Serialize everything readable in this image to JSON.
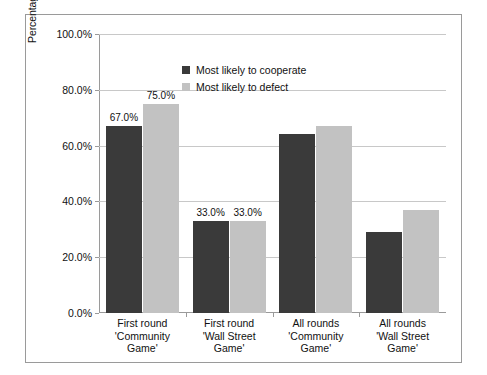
{
  "chart_data": {
    "type": "bar",
    "title": "",
    "xlabel": "",
    "ylabel": "Percentage of participants cooperating",
    "ylim": [
      0,
      100
    ],
    "ytick_labels": [
      "0.0%",
      "20.0%",
      "40.0%",
      "60.0%",
      "80.0%",
      "100.0%"
    ],
    "ytick_values": [
      0,
      20,
      40,
      60,
      80,
      100
    ],
    "grid": true,
    "legend_position": "top-left inside plot",
    "categories": [
      "First round 'Community Game'",
      "First round 'Wall Street Game'",
      "All rounds 'Community Game'",
      "All rounds 'Wall Street Game'"
    ],
    "category_lines": [
      [
        "First round",
        "'Community",
        "Game'"
      ],
      [
        "First round",
        "'Wall Street",
        "Game'"
      ],
      [
        "All rounds",
        "'Community",
        "Game'"
      ],
      [
        "All rounds",
        "'Wall Street",
        "Game'"
      ]
    ],
    "series": [
      {
        "name": "Most likely to cooperate",
        "color": "#3a3a3a",
        "values": [
          67.0,
          33.0,
          64.0,
          29.0
        ],
        "labels": [
          "67.0%",
          "33.0%",
          "",
          ""
        ]
      },
      {
        "name": "Most likely to defect",
        "color": "#c2c2c2",
        "values": [
          75.0,
          33.0,
          67.0,
          37.0
        ],
        "labels": [
          "75.0%",
          "33.0%",
          "",
          ""
        ]
      }
    ]
  },
  "colors": {
    "series_cooperate": "#3a3a3a",
    "series_defect": "#c2c2c2",
    "gridline": "#c8c8c8",
    "axis": "#9a9a9a",
    "border": "#9a9a9a",
    "background": "#ffffff",
    "text": "#111111"
  }
}
